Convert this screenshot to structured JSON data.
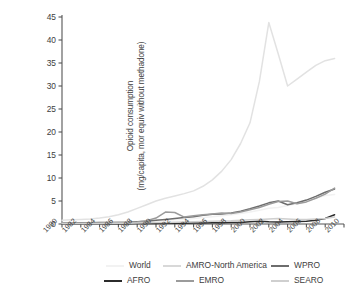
{
  "axes": {
    "ylabel_line1": "Opioid consumption",
    "ylabel_line2": "(mg/capita, mor equiv without methadone)",
    "yticks": [
      "0",
      "5",
      "10",
      "15",
      "20",
      "25",
      "30",
      "35",
      "40",
      "45"
    ],
    "xticks": [
      "1980",
      "1982",
      "1984",
      "1986",
      "1988",
      "1990",
      "1992",
      "1994",
      "1996",
      "1998",
      "2000",
      "2002",
      "2004",
      "2006",
      "2008",
      "2010"
    ]
  },
  "legend": {
    "row1": [
      {
        "label": "World",
        "color": "#f2f2f2"
      },
      {
        "label": "AMRO-North America",
        "color": "#d8d8d8"
      },
      {
        "label": "WPRO",
        "color": "#6d6d6d"
      }
    ],
    "row2": [
      {
        "label": "AFRO",
        "color": "#2b2b2b"
      },
      {
        "label": "EMRO",
        "color": "#9b9b9b"
      },
      {
        "label": "SEARO",
        "color": "#cfcfcf"
      }
    ]
  },
  "chart_data": {
    "type": "line",
    "title": "",
    "xlabel": "",
    "ylabel": "Opioid consumption (mg/capita, mor equiv without methadone)",
    "xlim": [
      1980,
      2010
    ],
    "ylim": [
      0,
      45
    ],
    "grid": false,
    "legend_position": "bottom",
    "x": [
      1980,
      1981,
      1982,
      1983,
      1984,
      1985,
      1986,
      1987,
      1988,
      1989,
      1990,
      1991,
      1992,
      1993,
      1994,
      1995,
      1996,
      1997,
      1998,
      1999,
      2000,
      2001,
      2002,
      2003,
      2004,
      2005,
      2006,
      2007,
      2008,
      2009
    ],
    "series": [
      {
        "name": "World",
        "color": "#f2f2f2",
        "values": [
          0.35,
          0.35,
          0.35,
          0.35,
          0.4,
          0.4,
          0.45,
          0.5,
          0.55,
          0.6,
          0.7,
          0.8,
          0.9,
          1.0,
          1.2,
          1.4,
          1.6,
          1.8,
          2.0,
          2.3,
          2.6,
          3.0,
          3.4,
          3.6,
          4.0,
          4.4,
          5.0,
          5.6,
          6.2,
          6.4
        ]
      },
      {
        "name": "AMRO-North America",
        "color": "#e2e2e2",
        "values": [
          0.8,
          0.9,
          1.0,
          1.1,
          1.3,
          1.6,
          2.0,
          2.6,
          3.4,
          4.2,
          5.0,
          5.6,
          6.1,
          6.6,
          7.2,
          8.2,
          9.6,
          11.5,
          14.0,
          17.5,
          22.0,
          31.0,
          43.8,
          37.0,
          30.0,
          31.5,
          33.0,
          34.5,
          35.5,
          36.0
        ]
      },
      {
        "name": "WPRO",
        "color": "#6d6d6d",
        "values": [
          0.2,
          0.2,
          0.25,
          0.25,
          0.3,
          0.3,
          0.35,
          0.4,
          0.5,
          0.6,
          0.8,
          1.0,
          1.2,
          1.4,
          1.6,
          1.9,
          2.1,
          2.2,
          2.4,
          2.8,
          3.3,
          3.9,
          4.6,
          5.0,
          4.2,
          4.6,
          5.2,
          6.0,
          6.9,
          7.6
        ]
      },
      {
        "name": "AFRO",
        "color": "#2b2b2b",
        "values": [
          0.05,
          0.05,
          0.05,
          0.05,
          0.06,
          0.06,
          0.07,
          0.08,
          0.09,
          0.1,
          0.12,
          0.14,
          0.16,
          0.18,
          0.2,
          0.22,
          0.25,
          0.28,
          0.3,
          0.35,
          0.5,
          0.6,
          0.5,
          0.45,
          0.5,
          0.55,
          0.6,
          0.8,
          1.2,
          2.0
        ]
      },
      {
        "name": "EMRO",
        "color": "#9b9b9b",
        "values": [
          0.15,
          0.15,
          0.18,
          0.2,
          0.22,
          0.25,
          0.3,
          0.35,
          0.45,
          0.7,
          1.3,
          2.6,
          2.5,
          1.5,
          1.8,
          2.0,
          2.2,
          2.4,
          2.3,
          2.6,
          3.1,
          3.6,
          4.3,
          4.9,
          5.0,
          4.4,
          4.8,
          5.6,
          6.5,
          7.8
        ]
      },
      {
        "name": "SEARO",
        "color": "#cfcfcf",
        "values": [
          0.1,
          0.1,
          0.1,
          0.12,
          0.12,
          0.14,
          0.15,
          0.18,
          0.2,
          0.25,
          0.3,
          0.35,
          0.4,
          0.45,
          0.5,
          0.55,
          0.6,
          0.65,
          0.7,
          0.8,
          0.9,
          1.0,
          1.1,
          1.2,
          1.1,
          1.0,
          1.0,
          1.1,
          1.2,
          1.5
        ]
      }
    ]
  }
}
